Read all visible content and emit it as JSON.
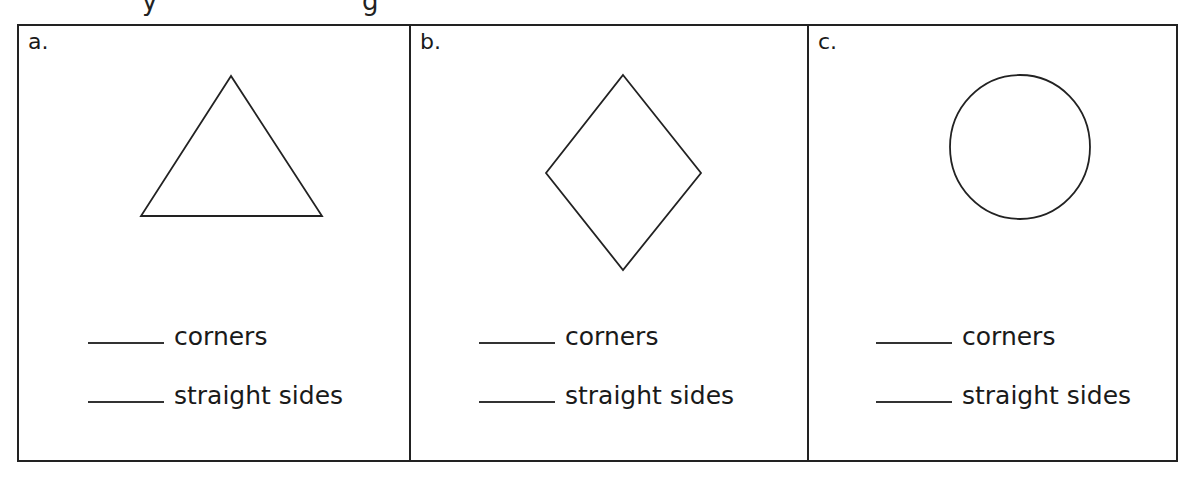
{
  "worksheet": {
    "cells": [
      {
        "label": "a.",
        "shape": "triangle",
        "answers": [
          {
            "blank": "",
            "text": "corners"
          },
          {
            "blank": "",
            "text": "straight sides"
          }
        ]
      },
      {
        "label": "b.",
        "shape": "diamond",
        "answers": [
          {
            "blank": "",
            "text": "corners"
          },
          {
            "blank": "",
            "text": "straight sides"
          }
        ]
      },
      {
        "label": "c.",
        "shape": "circle",
        "answers": [
          {
            "blank": "",
            "text": "corners"
          },
          {
            "blank": "",
            "text": "straight sides"
          }
        ]
      }
    ],
    "colors": {
      "ink": "#1a1a1a",
      "border": "#222222",
      "background": "#ffffff"
    }
  }
}
